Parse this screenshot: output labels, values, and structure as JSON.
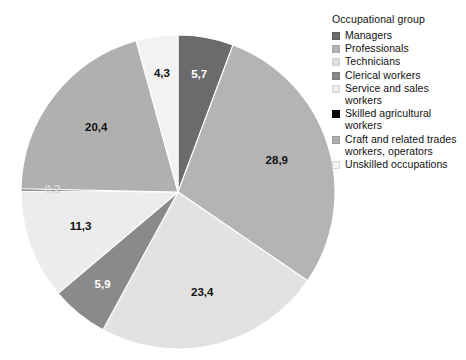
{
  "chart_data": {
    "type": "pie",
    "title": "",
    "legend_title": "Occupational group",
    "legend_position": "right",
    "value_format": "decimal-comma",
    "unit": "%",
    "start_angle_deg": 0,
    "direction": "clockwise",
    "categories": [
      "Managers",
      "Professionals",
      "Technicians",
      "Clerical workers",
      "Service and sales workers",
      "Skilled agricultural workers",
      "Craft and related trades workers, operators",
      "Unskilled occupations"
    ],
    "values": [
      5.7,
      28.9,
      23.4,
      5.9,
      11.3,
      0.2,
      20.4,
      4.3
    ],
    "labels": [
      "5,7",
      "28,9",
      "23,4",
      "5,9",
      "11,3",
      "0,2",
      "20,4",
      "4,3"
    ],
    "colors": [
      "#6b6b6b",
      "#b4b4b4",
      "#e2e2e2",
      "#8a8a8a",
      "#ececec",
      "#050505",
      "#b0b0b0",
      "#f2f2f2"
    ],
    "slices": [
      {
        "name": "Managers",
        "label": "5,7",
        "value": 5.7,
        "color": "#6b6b6b",
        "label_fill": "on-dark"
      },
      {
        "name": "Professionals",
        "label": "28,9",
        "value": 28.9,
        "color": "#b4b4b4",
        "label_fill": "normal"
      },
      {
        "name": "Technicians",
        "label": "23,4",
        "value": 23.4,
        "color": "#e2e2e2",
        "label_fill": "normal"
      },
      {
        "name": "Clerical workers",
        "label": "5,9",
        "value": 5.9,
        "color": "#8a8a8a",
        "label_fill": "on-dark"
      },
      {
        "name": "Service and sales workers",
        "label": "11,3",
        "value": 11.3,
        "color": "#ececec",
        "label_fill": "normal"
      },
      {
        "name": "Skilled agricultural workers",
        "label": "0,2",
        "value": 0.2,
        "color": "#050505",
        "label_fill": "on-black"
      },
      {
        "name": "Craft and related trades workers, operators",
        "label": "20,4",
        "value": 20.4,
        "color": "#b0b0b0",
        "label_fill": "normal"
      },
      {
        "name": "Unskilled occupations",
        "label": "4,3",
        "value": 4.3,
        "color": "#f2f2f2",
        "label_fill": "normal"
      }
    ],
    "geometry": {
      "cx": 178,
      "cy": 192,
      "r": 157
    }
  },
  "legend": {
    "title": "Occupational group",
    "items": [
      {
        "label": "Managers",
        "color": "#6b6b6b"
      },
      {
        "label": "Professionals",
        "color": "#b4b4b4"
      },
      {
        "label": "Technicians",
        "color": "#e2e2e2"
      },
      {
        "label": "Clerical workers",
        "color": "#8a8a8a"
      },
      {
        "label": "Service and sales workers",
        "color": "#ececec"
      },
      {
        "label": "Skilled agricultural workers",
        "color": "#050505"
      },
      {
        "label": "Craft and related trades workers, operators",
        "color": "#b0b0b0"
      },
      {
        "label": "Unskilled occupations",
        "color": "#f2f2f2"
      }
    ]
  }
}
